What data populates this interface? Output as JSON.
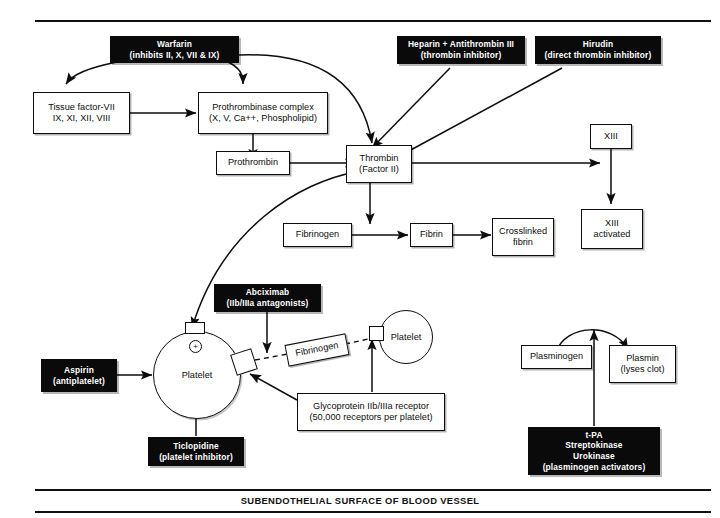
{
  "figure": {
    "caption": "SUBENDOTHELIAL SURFACE OF BLOOD VESSEL",
    "background_color": "#ffffff",
    "ink_color": "#0d0d0d",
    "drug_box_color": "#0a0a0a",
    "drug_box_text_color": "#ffffff"
  },
  "nodes": {
    "warfarin": {
      "line1": "Warfarin",
      "line2": "(inhibits II, X, VII & IX)",
      "style": "black"
    },
    "heparin": {
      "line1": "Heparin + Antithrombin III",
      "line2": "(thrombin inhibitor)",
      "style": "black"
    },
    "hirudin": {
      "line1": "Hirudin",
      "line2": "(direct thrombin inhibitor)",
      "style": "black"
    },
    "tissue_factor": {
      "line1": "Tissue factor-VII",
      "line2": "IX, XI, XII, VIII",
      "style": "white"
    },
    "prothrombinase": {
      "line1": "Prothrombinase complex",
      "line2": "(X, V, Ca++, Phospholipid)",
      "style": "white"
    },
    "prothrombin": {
      "line1": "Prothrombin",
      "style": "white"
    },
    "thrombin": {
      "line1": "Thrombin",
      "line2": "(Factor II)",
      "style": "white"
    },
    "xiii": {
      "line1": "XIII",
      "style": "white"
    },
    "xiii_activated": {
      "line1": "XIII",
      "line2": "activated",
      "style": "white"
    },
    "fibrinogen": {
      "line1": "Fibrinogen",
      "style": "white"
    },
    "fibrin": {
      "line1": "Fibrin",
      "style": "white"
    },
    "crosslinked_fibrin": {
      "line1": "Crosslinked",
      "line2": "fibrin",
      "style": "white"
    },
    "abciximab": {
      "line1": "Abciximab",
      "line2": "(IIb/IIIa antagonists)",
      "style": "black"
    },
    "aspirin": {
      "line1": "Aspirin",
      "line2": "(antiplatelet)",
      "style": "black"
    },
    "ticlopidine": {
      "line1": "Ticlopidine",
      "line2": "(platelet inhibitor)",
      "style": "black"
    },
    "fibrinogen_bridge": {
      "line1": "Fibrinogen",
      "style": "white"
    },
    "platelet_left": {
      "label": "Platelet"
    },
    "platelet_right": {
      "label": "Platelet"
    },
    "gp_receptor": {
      "line1": "Glycoprotein IIb/IIIa receptor",
      "line2": "(50,000 receptors per platelet)",
      "style": "white"
    },
    "plasminogen": {
      "line1": "Plasminogen",
      "style": "white"
    },
    "plasmin": {
      "line1": "Plasmin",
      "line2": "(lyses clot)",
      "style": "white"
    },
    "activators": {
      "line1": "t-PA",
      "line2": "Streptokinase",
      "line3": "Urokinase",
      "line4": "(plasminogen activators)",
      "style": "black"
    }
  },
  "markers": {
    "platelet_activation_plus": "+"
  }
}
